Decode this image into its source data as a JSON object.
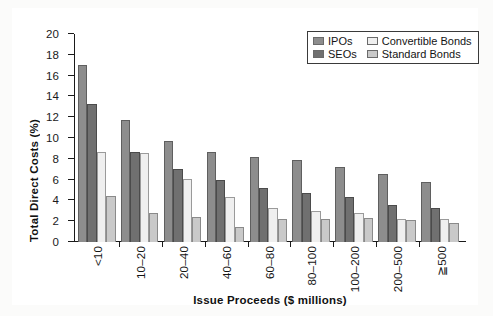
{
  "chart_data": {
    "type": "bar",
    "title": "",
    "xlabel": "Issue Proceeds ($ millions)",
    "ylabel": "Total Direct Costs (%)",
    "ylim": [
      0,
      20
    ],
    "ytick_step": 2,
    "yticks": [
      "0",
      "2",
      "4",
      "6",
      "8",
      "10",
      "12",
      "14",
      "16",
      "18",
      "20"
    ],
    "grid": false,
    "legend_position": "top-right",
    "categories": [
      "<10",
      "10–20",
      "20–40",
      "40–60",
      "60–80",
      "80–100",
      "100–200",
      "200–500",
      "≧500"
    ],
    "series": [
      {
        "name": "IPOs",
        "color": "#8d8d8d",
        "values": [
          17.0,
          11.7,
          9.7,
          8.7,
          8.2,
          7.9,
          7.2,
          6.5,
          5.8
        ]
      },
      {
        "name": "SEOs",
        "color": "#707070",
        "values": [
          13.3,
          8.7,
          7.0,
          6.0,
          5.2,
          4.7,
          4.3,
          3.6,
          3.3
        ]
      },
      {
        "name": "Convertible Bonds",
        "color": "#efefef",
        "values": [
          8.7,
          8.6,
          6.1,
          4.3,
          3.3,
          3.0,
          2.8,
          2.2,
          2.2
        ]
      },
      {
        "name": "Standard Bonds",
        "color": "#c9c9c9",
        "values": [
          4.4,
          2.8,
          2.4,
          1.4,
          2.2,
          2.2,
          2.3,
          2.1,
          1.8
        ]
      }
    ]
  },
  "legend": {
    "entries": [
      {
        "label": "IPOs"
      },
      {
        "label": "Convertible Bonds"
      },
      {
        "label": "SEOs"
      },
      {
        "label": "Standard Bonds"
      }
    ]
  }
}
